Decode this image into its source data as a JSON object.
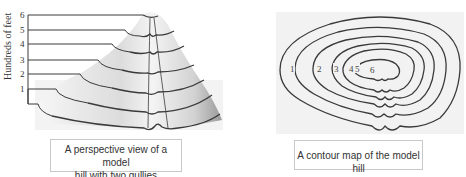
{
  "perspective_view": {
    "axis_title": "Hundreds of feet",
    "levels": [
      "1",
      "2",
      "3",
      "4",
      "5",
      "6"
    ],
    "caption_line1": "A perspective view of a model",
    "caption_line2": "hill with two gullies"
  },
  "contour_map": {
    "labels": [
      "1",
      "2",
      "3",
      "4",
      "5",
      "6"
    ],
    "caption": "A contour map of the model hill"
  },
  "colors": {
    "line": "#3a3a3a",
    "hill_fill": "#e6e6e6",
    "map_fill": "#efefef"
  }
}
